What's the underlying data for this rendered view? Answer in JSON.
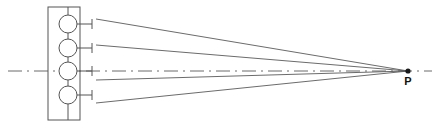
{
  "diagram": {
    "type": "line-diagram",
    "canvas": {
      "width": 448,
      "height": 134,
      "background": "#ffffff"
    },
    "colors": {
      "line": "#555555",
      "ray": "#5a5a5a",
      "axis": "#6a6a6a",
      "label": "#111111",
      "fill": "#ffffff"
    },
    "array_housing": {
      "label": "array-housing",
      "x": 48,
      "y": 7,
      "width": 32,
      "height": 113
    },
    "spine": {
      "label": "array-spine",
      "x": 68,
      "y_top": 7,
      "y_bottom": 120
    },
    "elements": [
      {
        "id": 1,
        "label": "array-element-1",
        "cx": 68,
        "cy": 24,
        "r": 9,
        "stub_x1": 77,
        "stub_x2": 92,
        "stub_tick_x": 92,
        "stub_tick_half": 5
      },
      {
        "id": 2,
        "label": "array-element-2",
        "cx": 68,
        "cy": 48,
        "r": 9,
        "stub_x1": 77,
        "stub_x2": 92,
        "stub_tick_x": 92,
        "stub_tick_half": 5
      },
      {
        "id": 3,
        "label": "array-element-3",
        "cx": 68,
        "cy": 71,
        "r": 9,
        "stub_x1": 77,
        "stub_x2": 92,
        "stub_tick_x": 92,
        "stub_tick_half": 5
      },
      {
        "id": 4,
        "label": "array-element-4",
        "cx": 68,
        "cy": 95,
        "r": 9,
        "stub_x1": 77,
        "stub_x2": 92,
        "stub_tick_x": 92,
        "stub_tick_half": 5
      }
    ],
    "rays": [
      {
        "id": 1,
        "label": "ray-from-element-1",
        "x1": 96,
        "y1": 19,
        "x2": 408,
        "y2": 71
      },
      {
        "id": 2,
        "label": "ray-from-element-2",
        "x1": 96,
        "y1": 45,
        "x2": 408,
        "y2": 71
      },
      {
        "id": 3,
        "label": "ray-from-element-3",
        "x1": 96,
        "y1": 80,
        "x2": 408,
        "y2": 71
      },
      {
        "id": 4,
        "label": "ray-from-element-4",
        "x1": 96,
        "y1": 103,
        "x2": 408,
        "y2": 71
      }
    ],
    "axis": {
      "label": "optical-axis",
      "x1": 8,
      "x2": 432,
      "y": 71,
      "style": "dash-dot",
      "dasharray": "14 5 2 5"
    },
    "focal_point": {
      "label": "P",
      "x": 408,
      "y": 71,
      "dot_radius": 2.6,
      "label_x": 408,
      "label_y": 85
    }
  }
}
